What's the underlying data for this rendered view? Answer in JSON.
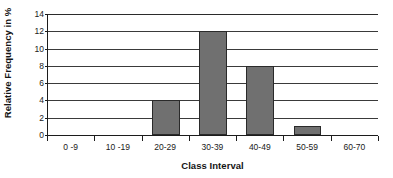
{
  "chart_data": {
    "type": "bar",
    "title": "",
    "subtitle": "",
    "xlabel": "Class Interval",
    "ylabel": "Relative Frequency in %",
    "categories": [
      "0 -9",
      "10 -19",
      "20-29",
      "30-39",
      "40-49",
      "50-59",
      "60-70"
    ],
    "values": [
      0,
      0,
      4,
      12,
      8,
      1,
      0
    ],
    "ylim": [
      0,
      14
    ],
    "ytick_step": 2,
    "yticks": [
      0,
      2,
      4,
      6,
      8,
      10,
      12,
      14
    ],
    "ytick_labels": [
      "0",
      "2",
      "4",
      "6",
      "8",
      "10",
      "12",
      "14"
    ],
    "grid": "horizontal",
    "legend": "none",
    "bar_color": "#707070",
    "bar_border_color": "#2a2a2a",
    "axis_color": "#1c1c1c",
    "gridline_color": "#3a3a3a",
    "background_color": "#ffffff",
    "text_color": "#1a1a1a"
  }
}
